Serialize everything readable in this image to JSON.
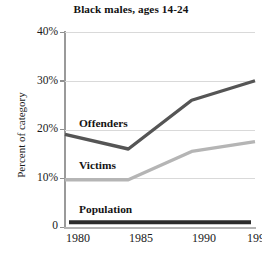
{
  "chart_data": {
    "type": "line",
    "title": "Black males, ages 14-24",
    "xlabel": "",
    "ylabel": "Percent of category",
    "x": [
      "1980",
      "1985",
      "1990",
      "1997"
    ],
    "categories": [
      "1980",
      "1985",
      "1990",
      "1997"
    ],
    "ylim": [
      0,
      40
    ],
    "yticks": [
      0,
      10,
      20,
      30,
      40
    ],
    "ytick_labels": [
      "0",
      "10%",
      "20%",
      "30%",
      "40%"
    ],
    "grid": true,
    "legend": "inline-annotations",
    "series": [
      {
        "name": "Offenders",
        "values": [
          19.0,
          16.0,
          26.0,
          30.0
        ],
        "color": "#555555"
      },
      {
        "name": "Victims",
        "values": [
          9.7,
          9.7,
          15.5,
          17.5
        ],
        "color": "#b5b5b5"
      },
      {
        "name": "Population",
        "values": [
          1.0,
          1.0,
          1.0,
          1.0
        ],
        "color": "#2b2b2b"
      }
    ],
    "annotations": [
      {
        "text": "Offenders",
        "series": "Offenders"
      },
      {
        "text": "Victims",
        "series": "Victims"
      },
      {
        "text": "Population",
        "series": "Population"
      }
    ]
  },
  "colors": {
    "background": "#ffffff",
    "text": "#1a1a1a",
    "grid": "#d9d9d9",
    "axis": "#9a9a9a",
    "offenders": "#555555",
    "victims": "#b5b5b5",
    "population": "#2b2b2b"
  }
}
